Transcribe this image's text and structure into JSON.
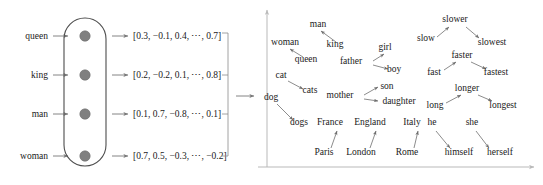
{
  "figure": {
    "colors": {
      "text": "#1a1a1a",
      "node_fill": "#808080",
      "capsule_stroke": "#4d4d4d",
      "axis": "#b9b9b9",
      "relation_arrow": "#6e6e6e",
      "flow_arrow": "#767676",
      "background": "#ffffff"
    }
  },
  "left_panel": {
    "name": "embedding-lookup",
    "input_words": [
      {
        "label": "queen",
        "x": 30,
        "y": 36
      },
      {
        "label": "king",
        "x": 30,
        "y": 75
      },
      {
        "label": "man",
        "x": 30,
        "y": 114
      },
      {
        "label": "woman",
        "x": 30,
        "y": 156
      }
    ],
    "capsule": {
      "x": 64,
      "y": 18,
      "width": 40,
      "height": 148,
      "radius": 20
    },
    "nodes": [
      {
        "cx": 85,
        "cy": 36,
        "r": 5.2
      },
      {
        "cx": 85,
        "cy": 75,
        "r": 5.2
      },
      {
        "cx": 85,
        "cy": 114,
        "r": 5.2
      },
      {
        "cx": 85,
        "cy": 156,
        "r": 5.2
      }
    ],
    "vectors": [
      {
        "text": "[0.3, −0.1, 0.4, ⋯, 0.7]",
        "x": 133,
        "y": 39
      },
      {
        "text": "[0.2, −0.2, 0.1, ⋯, 0.8]",
        "x": 133,
        "y": 78
      },
      {
        "text": "[0.1, 0.7, −0.8, ⋯, 0.1]",
        "x": 133,
        "y": 117
      },
      {
        "text": "[0.7, 0.5, −0.3, ⋯, −0.2]",
        "x": 133,
        "y": 159
      }
    ],
    "brace": {
      "x": 228,
      "top": 33,
      "bottom": 156,
      "tick": 6
    },
    "transfer_arrow": {
      "x1": 236,
      "x2": 254,
      "y": 96
    }
  },
  "right_panel": {
    "name": "embedding-space-plot",
    "axes": {
      "origin_x": 267,
      "origin_y": 167,
      "y_top": 10,
      "x_right": 534
    },
    "words": [
      {
        "label": "man",
        "x": 318,
        "y": 27
      },
      {
        "label": "woman",
        "x": 285,
        "y": 45
      },
      {
        "label": "king",
        "x": 335,
        "y": 47
      },
      {
        "label": "queen",
        "x": 306,
        "y": 62
      },
      {
        "label": "girl",
        "x": 385,
        "y": 50
      },
      {
        "label": "father",
        "x": 351,
        "y": 64
      },
      {
        "label": "boy",
        "x": 392,
        "y": 72
      },
      {
        "label": "cat",
        "x": 281,
        "y": 78
      },
      {
        "label": "cats",
        "x": 308,
        "y": 93
      },
      {
        "label": "dog",
        "x": 270,
        "y": 100
      },
      {
        "label": "dogs",
        "x": 297,
        "y": 125
      },
      {
        "label": "mother",
        "x": 340,
        "y": 98
      },
      {
        "label": "son",
        "x": 384,
        "y": 89
      },
      {
        "label": "daughter",
        "x": 382,
        "y": 104
      },
      {
        "label": "France",
        "x": 325,
        "y": 125
      },
      {
        "label": "England",
        "x": 363,
        "y": 125
      },
      {
        "label": "Italy",
        "x": 409,
        "y": 125
      },
      {
        "label": "Paris",
        "x": 322,
        "y": 155
      },
      {
        "label": "London",
        "x": 357,
        "y": 155
      },
      {
        "label": "Rome",
        "x": 404,
        "y": 155
      },
      {
        "label": "slower",
        "x": 449,
        "y": 22
      },
      {
        "label": "slow",
        "x": 424,
        "y": 41
      },
      {
        "label": "slowest",
        "x": 470,
        "y": 45
      },
      {
        "label": "faster",
        "x": 455,
        "y": 58
      },
      {
        "label": "fast",
        "x": 432,
        "y": 75
      },
      {
        "label": "fastest",
        "x": 477,
        "y": 75
      },
      {
        "label": "longer",
        "x": 459,
        "y": 91
      },
      {
        "label": "long",
        "x": 432,
        "y": 108
      },
      {
        "label": "longest",
        "x": 481,
        "y": 108
      },
      {
        "label": "he",
        "x": 431,
        "y": 125
      },
      {
        "label": "she",
        "x": 470,
        "y": 125
      },
      {
        "label": "himself",
        "x": 441,
        "y": 155
      },
      {
        "label": "herself",
        "x": 481,
        "y": 155
      }
    ],
    "relations": [
      {
        "from": "king",
        "to": "man",
        "x1": 336,
        "y1": 42,
        "x2": 321,
        "y2": 31
      },
      {
        "from": "queen",
        "to": "woman",
        "x1": 303,
        "y1": 57,
        "x2": 290,
        "y2": 49
      },
      {
        "from": "cat",
        "to": "cats",
        "x1": 288,
        "y1": 81,
        "x2": 303,
        "y2": 89
      },
      {
        "from": "dog",
        "to": "dogs",
        "x1": 277,
        "y1": 104,
        "x2": 293,
        "y2": 120
      },
      {
        "from": "father",
        "to": "girl",
        "x1": 373,
        "y1": 61,
        "x2": 384,
        "y2": 54
      },
      {
        "from": "father",
        "to": "boy",
        "x1": 373,
        "y1": 65,
        "x2": 388,
        "y2": 69
      },
      {
        "from": "mother",
        "to": "son",
        "x1": 364,
        "y1": 95,
        "x2": 378,
        "y2": 87
      },
      {
        "from": "mother",
        "to": "daughter",
        "x1": 364,
        "y1": 99,
        "x2": 378,
        "y2": 101
      },
      {
        "from": "Paris",
        "to": "France",
        "x1": 331,
        "y1": 148,
        "x2": 337,
        "y2": 131
      },
      {
        "from": "London",
        "to": "England",
        "x1": 370,
        "y1": 148,
        "x2": 376,
        "y2": 131
      },
      {
        "from": "Rome",
        "to": "Italy",
        "x1": 414,
        "y1": 148,
        "x2": 418,
        "y2": 131
      },
      {
        "from": "slow",
        "to": "slower",
        "x1": 437,
        "y1": 37,
        "x2": 449,
        "y2": 27
      },
      {
        "from": "slower",
        "to": "slowest",
        "x1": 466,
        "y1": 27,
        "x2": 479,
        "y2": 38
      },
      {
        "from": "fast",
        "to": "faster",
        "x1": 444,
        "y1": 70,
        "x2": 456,
        "y2": 62
      },
      {
        "from": "faster",
        "to": "fastest",
        "x1": 471,
        "y1": 62,
        "x2": 486,
        "y2": 69
      },
      {
        "from": "long",
        "to": "longer",
        "x1": 446,
        "y1": 103,
        "x2": 461,
        "y2": 95
      },
      {
        "from": "longer",
        "to": "longest",
        "x1": 478,
        "y1": 95,
        "x2": 492,
        "y2": 101
      },
      {
        "from": "he",
        "to": "himself",
        "x1": 436,
        "y1": 131,
        "x2": 450,
        "y2": 148
      },
      {
        "from": "she",
        "to": "herself",
        "x1": 476,
        "y1": 131,
        "x2": 489,
        "y2": 148
      }
    ]
  }
}
